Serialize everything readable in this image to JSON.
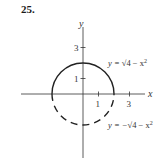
{
  "problem_number": "25.",
  "axes": {
    "x_label": "x",
    "y_label": "y",
    "x_ticks": [
      "1",
      "3"
    ],
    "y_ticks": [
      "1",
      "3"
    ]
  },
  "curves": {
    "upper": {
      "label_prefix": "y = ",
      "label_body": "√4 − x",
      "exp": "2",
      "style": "solid"
    },
    "lower": {
      "label_prefix": "y = −",
      "label_body": "√4 − x",
      "exp": "2",
      "style": "dashed"
    }
  },
  "colors": {
    "ink": "#222222"
  }
}
